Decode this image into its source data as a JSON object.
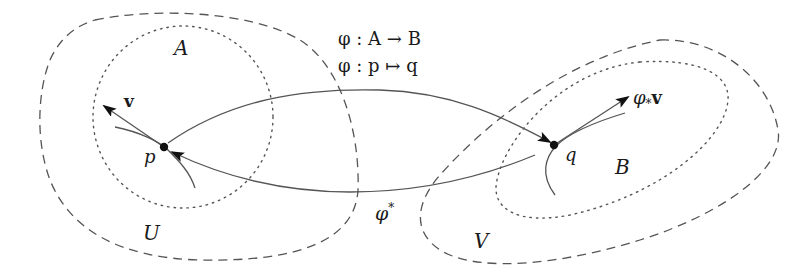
{
  "diagram": {
    "title_lines": [
      "φ : A → B",
      "φ : p ↦ q"
    ],
    "regions": {
      "U": {
        "label": "U",
        "style": "dashed"
      },
      "A": {
        "label": "A",
        "style": "dotted"
      },
      "V": {
        "label": "V",
        "style": "dashed"
      },
      "B": {
        "label": "B",
        "style": "dotted"
      }
    },
    "points": {
      "p": {
        "label": "p"
      },
      "q": {
        "label": "q"
      }
    },
    "vectors": {
      "v": {
        "label": "v"
      },
      "pushforward": {
        "label_base": "φ",
        "label_sub": "*",
        "label_vec": "v"
      }
    },
    "maps": {
      "forward": {
        "label": "φ : p ↦ q"
      },
      "pullback": {
        "label_base": "φ",
        "label_sup": "*"
      }
    },
    "colors": {
      "stroke": "#555555",
      "ink": "#1a1a1a",
      "background": "#ffffff"
    }
  }
}
